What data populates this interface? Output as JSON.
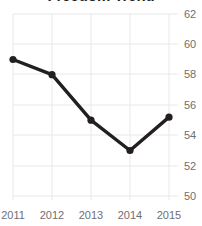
{
  "chart_data": {
    "type": "line",
    "title": "Freedom Trend",
    "xlabel": "",
    "ylabel": "",
    "categories": [
      "2011",
      "2012",
      "2013",
      "2014",
      "2015"
    ],
    "x": [
      2011,
      2012,
      2013,
      2014,
      2015
    ],
    "values": [
      59.0,
      58.0,
      55.0,
      53.0,
      55.2
    ],
    "series": [
      {
        "name": "Freedom Trend",
        "values": [
          59.0,
          58.0,
          55.0,
          53.0,
          55.2
        ]
      }
    ],
    "ylim": [
      50,
      62
    ],
    "yticks": [
      62,
      60,
      58,
      56,
      54,
      52,
      50
    ],
    "ytick_labels": [
      "62",
      "60",
      "58",
      "56",
      "54",
      "52",
      "50"
    ],
    "xtick_labels": [
      "2011",
      "2012",
      "2013",
      "2014",
      "2015"
    ],
    "grid": true,
    "grid_axis": "both",
    "legend": false,
    "legend_position": "none",
    "yaxis_side": "right",
    "marker": "circle",
    "colors": {
      "line": "#231f20",
      "marker": "#231f20",
      "grid": "#e8e8e8",
      "tick_label": "#6f6f6f",
      "title": "#231f20",
      "background": "#ffffff"
    }
  }
}
